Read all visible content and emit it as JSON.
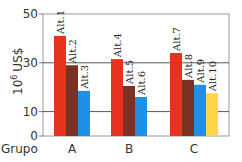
{
  "chart_data": {
    "type": "bar",
    "title": "",
    "xlabel": "Grupo",
    "ylabel": "10^6 US$",
    "ylabel_base": "10",
    "ylabel_exp": "6",
    "ylabel_unit": "US$",
    "ylim": [
      0,
      50
    ],
    "yticks": [
      0,
      10,
      30,
      50
    ],
    "grid": true,
    "legend": "none",
    "categories": [
      "A",
      "B",
      "C"
    ],
    "groups": [
      {
        "name": "A",
        "bars": [
          {
            "label": "Alt.1",
            "value": 41,
            "color": "#e8311f"
          },
          {
            "label": "Alt.2",
            "value": 29,
            "color": "#7a3322"
          },
          {
            "label": "Alt.3",
            "value": 18.5,
            "color": "#1e90e6"
          }
        ]
      },
      {
        "name": "B",
        "bars": [
          {
            "label": "Alt.4",
            "value": 31.5,
            "color": "#e8311f"
          },
          {
            "label": "Alt.5",
            "value": 20.5,
            "color": "#7a3322"
          },
          {
            "label": "Alt.6",
            "value": 16,
            "color": "#1e90e6"
          }
        ]
      },
      {
        "name": "C",
        "bars": [
          {
            "label": "Alt.7",
            "value": 34,
            "color": "#e8311f"
          },
          {
            "label": "Alt.8",
            "value": 23,
            "color": "#7a3322"
          },
          {
            "label": "Alt.9",
            "value": 21,
            "color": "#1e90e6"
          },
          {
            "label": "Alt.10",
            "value": 17.5,
            "color": "#fcd54a"
          }
        ]
      }
    ]
  },
  "colors": {
    "red": "#e8311f",
    "brown": "#7a3322",
    "blue": "#1e90e6",
    "yellow": "#fcd54a",
    "gridline": "#555555",
    "frame": "#999999"
  }
}
